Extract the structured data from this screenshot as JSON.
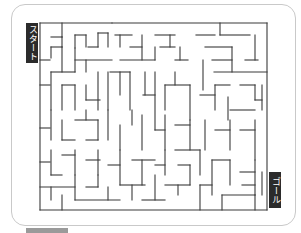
{
  "maze": {
    "start_label": "スタート",
    "goal_label": "ゴール",
    "colors": {
      "wall": "#3a3a3a",
      "label_bg": "#2b2b2b",
      "label_text": "#ffffff",
      "frame": "#c9c9c9"
    },
    "walls": [
      [
        40,
        23,
        267,
        23
      ],
      [
        40,
        23,
        40,
        210
      ],
      [
        40,
        210,
        267,
        210
      ],
      [
        267,
        23,
        267,
        210
      ],
      [
        62,
        23,
        62,
        37
      ],
      [
        62,
        37,
        62,
        47
      ],
      [
        51,
        37,
        62,
        37
      ],
      [
        75,
        35,
        86,
        35
      ],
      [
        75,
        35,
        75,
        48
      ],
      [
        86,
        35,
        86,
        47
      ],
      [
        98,
        33,
        98,
        47
      ],
      [
        98,
        33,
        108,
        33
      ],
      [
        88,
        47,
        98,
        47
      ],
      [
        108,
        33,
        108,
        47
      ],
      [
        40,
        60,
        50,
        60
      ],
      [
        51,
        47,
        51,
        58
      ],
      [
        51,
        47,
        62,
        47
      ],
      [
        62,
        47,
        62,
        72
      ],
      [
        51,
        72,
        75,
        72
      ],
      [
        75,
        48,
        75,
        72
      ],
      [
        75,
        60,
        112,
        60
      ],
      [
        86,
        72,
        86,
        60
      ],
      [
        112,
        23,
        112,
        23
      ],
      [
        115,
        35,
        132,
        35
      ],
      [
        120,
        35,
        120,
        47
      ],
      [
        130,
        47,
        142,
        47
      ],
      [
        142,
        35,
        142,
        60
      ],
      [
        155,
        35,
        175,
        35
      ],
      [
        160,
        47,
        175,
        47
      ],
      [
        170,
        35,
        170,
        47
      ],
      [
        120,
        60,
        155,
        60
      ],
      [
        155,
        47,
        155,
        60
      ],
      [
        175,
        60,
        188,
        60
      ],
      [
        180,
        47,
        180,
        60
      ],
      [
        220,
        23,
        220,
        35
      ],
      [
        220,
        35,
        250,
        35
      ],
      [
        196,
        35,
        215,
        35
      ],
      [
        205,
        47,
        232,
        47
      ],
      [
        255,
        35,
        255,
        60
      ],
      [
        245,
        60,
        258,
        60
      ],
      [
        232,
        47,
        232,
        72
      ],
      [
        212,
        60,
        232,
        60
      ],
      [
        214,
        72,
        267,
        72
      ],
      [
        203,
        60,
        203,
        90
      ],
      [
        40,
        85,
        50,
        85
      ],
      [
        51,
        72,
        51,
        110
      ],
      [
        62,
        85,
        62,
        110
      ],
      [
        62,
        85,
        75,
        85
      ],
      [
        75,
        85,
        75,
        110
      ],
      [
        86,
        85,
        86,
        100
      ],
      [
        86,
        100,
        100,
        100
      ],
      [
        98,
        72,
        98,
        110
      ],
      [
        108,
        72,
        108,
        110
      ],
      [
        110,
        72,
        130,
        72
      ],
      [
        120,
        72,
        120,
        95
      ],
      [
        130,
        72,
        130,
        110
      ],
      [
        145,
        72,
        145,
        95
      ],
      [
        143,
        95,
        155,
        95
      ],
      [
        155,
        72,
        155,
        130
      ],
      [
        165,
        85,
        165,
        110
      ],
      [
        175,
        72,
        175,
        85
      ],
      [
        165,
        85,
        190,
        85
      ],
      [
        190,
        85,
        190,
        120
      ],
      [
        200,
        95,
        215,
        95
      ],
      [
        215,
        85,
        215,
        110
      ],
      [
        215,
        85,
        230,
        85
      ],
      [
        228,
        97,
        228,
        120
      ],
      [
        230,
        110,
        255,
        110
      ],
      [
        240,
        85,
        255,
        85
      ],
      [
        255,
        85,
        255,
        100
      ],
      [
        255,
        100,
        262,
        100
      ],
      [
        262,
        85,
        262,
        110
      ],
      [
        40,
        128,
        50,
        128
      ],
      [
        51,
        110,
        51,
        140
      ],
      [
        62,
        120,
        62,
        140
      ],
      [
        62,
        140,
        75,
        140
      ],
      [
        75,
        120,
        98,
        120
      ],
      [
        86,
        110,
        86,
        120
      ],
      [
        98,
        120,
        98,
        140
      ],
      [
        86,
        140,
        98,
        140
      ],
      [
        108,
        110,
        108,
        140
      ],
      [
        120,
        125,
        120,
        150
      ],
      [
        132,
        110,
        132,
        125
      ],
      [
        142,
        115,
        142,
        150
      ],
      [
        155,
        130,
        165,
        130
      ],
      [
        165,
        115,
        165,
        150
      ],
      [
        175,
        125,
        190,
        125
      ],
      [
        190,
        120,
        190,
        150
      ],
      [
        205,
        120,
        205,
        150
      ],
      [
        215,
        130,
        230,
        130
      ],
      [
        230,
        120,
        230,
        150
      ],
      [
        240,
        130,
        255,
        130
      ],
      [
        255,
        120,
        255,
        160
      ],
      [
        40,
        162,
        50,
        162
      ],
      [
        51,
        150,
        51,
        175
      ],
      [
        51,
        175,
        62,
        175
      ],
      [
        62,
        155,
        75,
        155
      ],
      [
        75,
        150,
        75,
        175
      ],
      [
        86,
        160,
        100,
        160
      ],
      [
        98,
        150,
        98,
        175
      ],
      [
        108,
        165,
        120,
        165
      ],
      [
        120,
        150,
        120,
        185
      ],
      [
        132,
        160,
        155,
        160
      ],
      [
        142,
        160,
        142,
        185
      ],
      [
        155,
        165,
        165,
        165
      ],
      [
        165,
        150,
        165,
        175
      ],
      [
        175,
        150,
        200,
        150
      ],
      [
        178,
        165,
        190,
        165
      ],
      [
        190,
        165,
        190,
        185
      ],
      [
        200,
        150,
        200,
        175
      ],
      [
        212,
        160,
        230,
        160
      ],
      [
        212,
        160,
        212,
        195
      ],
      [
        230,
        160,
        230,
        185
      ],
      [
        240,
        172,
        255,
        172
      ],
      [
        255,
        160,
        255,
        195
      ],
      [
        40,
        187,
        75,
        187
      ],
      [
        51,
        187,
        51,
        200
      ],
      [
        62,
        195,
        62,
        210
      ],
      [
        75,
        175,
        75,
        200
      ],
      [
        75,
        200,
        120,
        200
      ],
      [
        86,
        187,
        98,
        187
      ],
      [
        98,
        175,
        98,
        187
      ],
      [
        108,
        187,
        108,
        200
      ],
      [
        120,
        185,
        145,
        185
      ],
      [
        132,
        185,
        132,
        200
      ],
      [
        142,
        200,
        165,
        200
      ],
      [
        155,
        175,
        155,
        200
      ],
      [
        165,
        185,
        190,
        185
      ],
      [
        178,
        185,
        178,
        195
      ],
      [
        200,
        185,
        212,
        185
      ],
      [
        200,
        185,
        200,
        210
      ],
      [
        222,
        195,
        255,
        195
      ],
      [
        222,
        195,
        222,
        210
      ],
      [
        242,
        185,
        255,
        185
      ],
      [
        255,
        195,
        255,
        210
      ],
      [
        262,
        172,
        262,
        195
      ]
    ]
  }
}
